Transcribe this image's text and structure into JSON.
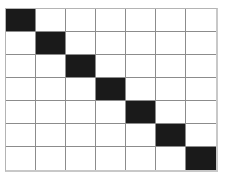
{
  "figure": {
    "name": "diagonal-matrix-grid",
    "colors": {
      "background": "#ffffff",
      "cell_empty": "#ffffff",
      "cell_filled": "#1a1a1a",
      "gridline": "#8c8c8c",
      "border": "#c8c8c8"
    }
  },
  "chart_data": {
    "type": "heatmap",
    "title": "",
    "subtitle": "",
    "xlabel": "",
    "ylabel": "",
    "rows": 7,
    "cols": 7,
    "row_labels": [
      "1",
      "2",
      "3",
      "4",
      "5",
      "6",
      "7"
    ],
    "col_labels": [
      "1",
      "2",
      "3",
      "4",
      "5",
      "6",
      "7"
    ],
    "tick_labels_visible": false,
    "legend": [],
    "legend_position": "none",
    "grid": true,
    "value_colors": {
      "0": "#ffffff",
      "1": "#1a1a1a"
    },
    "values": [
      [
        1,
        0,
        0,
        0,
        0,
        0,
        0
      ],
      [
        0,
        1,
        0,
        0,
        0,
        0,
        0
      ],
      [
        0,
        0,
        1,
        0,
        0,
        0,
        0
      ],
      [
        0,
        0,
        0,
        1,
        0,
        0,
        0
      ],
      [
        0,
        0,
        0,
        0,
        1,
        0,
        0
      ],
      [
        0,
        0,
        0,
        0,
        0,
        1,
        0
      ],
      [
        0,
        0,
        0,
        0,
        0,
        0,
        1
      ]
    ]
  }
}
